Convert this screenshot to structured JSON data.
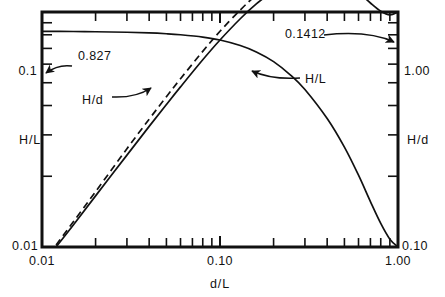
{
  "figure": {
    "kind": "log-log-engineering-chart",
    "caption_fragment": "",
    "colors": {
      "ink": "#111111",
      "background": "#ffffff"
    }
  },
  "chart_data": {
    "type": "line",
    "title": "",
    "xlabel": "d/L",
    "ylabel": "H/L",
    "ylabel_right": "H/d",
    "xscale": "log",
    "yscale": "log",
    "xlim": [
      0.01,
      1.0
    ],
    "ylim": [
      0.01,
      0.1
    ],
    "ylim_right": [
      0.1,
      1.0
    ],
    "grid": false,
    "legend": "inline-labels",
    "xticklabels": [
      "0.01",
      "0.10",
      "1.00"
    ],
    "xtickvalues": [
      0.01,
      0.1,
      1.0
    ],
    "yticklabels_left": [
      "0.01",
      "0.1"
    ],
    "ytickvalues_left": [
      0.01,
      0.1
    ],
    "yticklabels_right": [
      "0.10",
      "1.00"
    ],
    "ytickvalues_right": [
      0.1,
      1.0
    ],
    "minor_ticks_per_decade": [
      2,
      3,
      4,
      5,
      6,
      7,
      8,
      9
    ],
    "annotations": [
      {
        "name": "hd-limit-value",
        "text": "0.827",
        "points_to": "left-axis-intercept-of-H/d-curve"
      },
      {
        "name": "hl-limit-value",
        "text": "0.1412",
        "points_to": "right-end-of-H/L-curve"
      },
      {
        "name": "hd-curve-label",
        "text": "H/d",
        "points_to": "upper-flat-curve"
      },
      {
        "name": "hl-curve-label",
        "text": "H/L",
        "points_to": "rising-curve"
      }
    ],
    "series": [
      {
        "name": "H/d",
        "style": "solid",
        "axis": "right",
        "comment": "flat near 0.827 at small d/L, rolls off and decays toward 0.10 at d/L = 1",
        "x": [
          0.01,
          0.015,
          0.02,
          0.03,
          0.04,
          0.05,
          0.06,
          0.08,
          0.1,
          0.13,
          0.16,
          0.2,
          0.25,
          0.3,
          0.4,
          0.5,
          0.6,
          0.7,
          0.8,
          0.9,
          1.0
        ],
        "y": [
          0.827,
          0.826,
          0.824,
          0.82,
          0.815,
          0.808,
          0.8,
          0.782,
          0.76,
          0.72,
          0.676,
          0.615,
          0.538,
          0.468,
          0.352,
          0.266,
          0.202,
          0.156,
          0.126,
          0.108,
          0.1
        ]
      },
      {
        "name": "H/L",
        "style": "solid",
        "axis": "left",
        "comment": "rises nearly linearly on log-log from 0.01 and saturates at 0.1412",
        "x": [
          0.012,
          0.015,
          0.02,
          0.03,
          0.04,
          0.05,
          0.06,
          0.08,
          0.1,
          0.13,
          0.16,
          0.2,
          0.25,
          0.3,
          0.4,
          0.5,
          0.6,
          0.7,
          0.8,
          0.9,
          1.0
        ],
        "y": [
          0.01,
          0.0124,
          0.0165,
          0.0246,
          0.0326,
          0.0404,
          0.048,
          0.0626,
          0.076,
          0.0936,
          0.1082,
          0.123,
          0.1345,
          0.1404,
          0.1408,
          0.133,
          0.1212,
          0.1092,
          0.1008,
          0.0972,
          0.1
        ]
      },
      {
        "name": "H/L-dashed",
        "style": "dashed",
        "axis": "left",
        "comment": "shallow-water approximation, slightly above the solid H/L curve, merges with it near d/L = 0.2",
        "x": [
          0.012,
          0.015,
          0.02,
          0.03,
          0.04,
          0.05,
          0.06,
          0.08,
          0.1,
          0.13,
          0.16,
          0.2,
          0.24
        ],
        "y": [
          0.0102,
          0.0128,
          0.0172,
          0.0262,
          0.035,
          0.0436,
          0.052,
          0.068,
          0.0828,
          0.102,
          0.118,
          0.133,
          0.1412
        ]
      }
    ]
  },
  "axes": {
    "x_title": "d/L",
    "y_title_left": "H/L",
    "y_title_right": "H/d",
    "x_labels": [
      {
        "value": 0.01,
        "text": "0.01"
      },
      {
        "value": 0.1,
        "text": "0.10"
      },
      {
        "value": 1.0,
        "text": "1.00"
      }
    ],
    "y_labels_left": [
      {
        "value": 0.1,
        "text": "0.1"
      },
      {
        "value": 0.01,
        "text": "0.01"
      }
    ],
    "y_labels_right": [
      {
        "value": 1.0,
        "text": "1.00"
      },
      {
        "value": 0.1,
        "text": "0.10"
      }
    ]
  },
  "callouts": {
    "left_value": "0.827",
    "right_value": "0.1412",
    "curve_hd": "H/d",
    "curve_hl": "H/L"
  }
}
